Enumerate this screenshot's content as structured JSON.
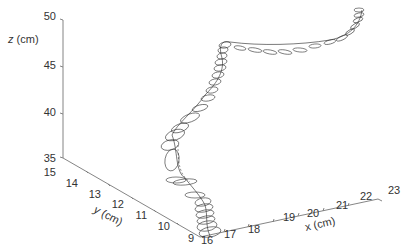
{
  "chart_data": {
    "type": "line3d",
    "title": "",
    "xlabel": "x (cm)",
    "ylabel": "y (cm)",
    "zlabel": "z (cm)",
    "xlim": [
      16,
      23
    ],
    "ylim": [
      9,
      15
    ],
    "zlim": [
      35,
      50
    ],
    "x_ticks": [
      "16",
      "17",
      "18",
      "19",
      "20",
      "21",
      "22",
      "23"
    ],
    "y_ticks": [
      "15",
      "14",
      "13",
      "12",
      "11",
      "10",
      "9"
    ],
    "z_ticks": [
      "50",
      "45",
      "40",
      "35"
    ],
    "grid": false,
    "legend": null,
    "series": [
      {
        "name": "trajectory with uncertainty ellipses",
        "description": "3D path rising from low z near (x≈17, y≈10) through a loop region, then climbing steeply near x≈18-19 to z≈45, running along x toward 22-23 and curling up to z≈50",
        "approx_points": [
          {
            "x": 17.0,
            "y": 10.0,
            "z": 35.5
          },
          {
            "x": 17.2,
            "y": 11.5,
            "z": 36.0
          },
          {
            "x": 17.5,
            "y": 13.0,
            "z": 38.5
          },
          {
            "x": 18.0,
            "y": 12.5,
            "z": 40.5
          },
          {
            "x": 18.5,
            "y": 12.0,
            "z": 42.0
          },
          {
            "x": 18.8,
            "y": 12.5,
            "z": 44.5
          },
          {
            "x": 19.5,
            "y": 12.5,
            "z": 45.5
          },
          {
            "x": 21.0,
            "y": 12.0,
            "z": 45.0
          },
          {
            "x": 22.5,
            "y": 11.5,
            "z": 45.5
          },
          {
            "x": 23.0,
            "y": 11.0,
            "z": 48.0
          },
          {
            "x": 23.0,
            "y": 11.0,
            "z": 50.0
          }
        ]
      }
    ]
  },
  "axes": {
    "z_label": "z (cm)",
    "y_label": "y (cm)",
    "x_label": "x (cm)",
    "z_ticks": [
      "50",
      "45",
      "40",
      "35"
    ],
    "y_ticks": [
      "15",
      "14",
      "13",
      "12",
      "11",
      "10",
      "9"
    ],
    "x_ticks": [
      "16",
      "17",
      "18",
      "19",
      "20",
      "21",
      "22",
      "23"
    ]
  }
}
